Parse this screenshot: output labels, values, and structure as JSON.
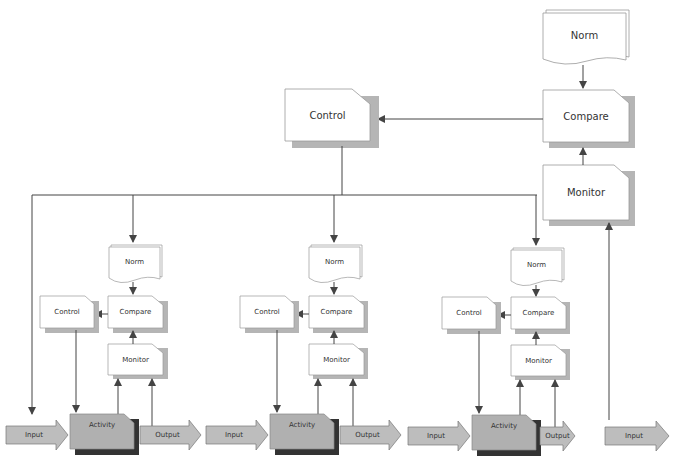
{
  "top": {
    "norm": "Norm",
    "compare": "Compare",
    "control": "Control",
    "monitor": "Monitor"
  },
  "units": [
    {
      "norm": "Norm",
      "compare": "Compare",
      "control": "Control",
      "monitor": "Monitor",
      "input": "Input",
      "activity": "Activity",
      "output": "Output"
    },
    {
      "norm": "Norm",
      "compare": "Compare",
      "control": "Control",
      "monitor": "Monitor",
      "input": "Input",
      "activity": "Activity",
      "output": "Output"
    },
    {
      "norm": "Norm",
      "compare": "Compare",
      "control": "Control",
      "monitor": "Monitor",
      "input": "Input",
      "activity": "Activity",
      "output": "Output"
    }
  ],
  "final_input": "Input",
  "colors": {
    "line": "#444444",
    "box_fill": "#ffffff",
    "box_border": "#888888",
    "shadow": "#b5b5b5",
    "activity_fill": "#b0b0b0",
    "activity_shadow": "#333333",
    "arrow_fill": "#bdbdbd"
  }
}
